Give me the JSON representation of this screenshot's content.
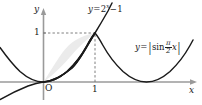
{
  "figure": {
    "background_color": "#ffffff",
    "axis_color": "#9a9a9a",
    "curve_color": "#1a1a1a",
    "shade_color": "#ebebeb",
    "shade_border_color": "#1a1a1a",
    "dotted_color": "#6f6f6f"
  },
  "axes": {
    "x_axis_label": "x",
    "y_axis_label": "y",
    "origin_label": "O",
    "x_ticks": [
      {
        "value": "1",
        "label": "1"
      }
    ],
    "y_ticks": [
      {
        "value": "1",
        "label": "1"
      }
    ],
    "x_range": [
      -1.05,
      3.3
    ],
    "y_range": [
      -0.62,
      1.55
    ]
  },
  "curves": [
    {
      "id": "exponential",
      "label_parts": {
        "lhs": "y",
        "equals": "=",
        "base": "2",
        "exponent": "x",
        "minus": "−",
        "constant": "1"
      },
      "label_plain": "y = 2^x − 1",
      "expression": "2^x - 1"
    },
    {
      "id": "abs-sine",
      "label_parts": {
        "lhs": "y",
        "equals": "=",
        "open_bar": "|",
        "fn": "sin",
        "num": "π",
        "den": "2",
        "var": "x",
        "close_bar": "|"
      },
      "label_plain": "y = |sin (π/2) x|",
      "expression": "abs(sin(pi/2 * x))"
    }
  ],
  "shaded_region": {
    "description": "Region between y = |sin((pi/2)x)| and y = 2^x - 1 from x = 0 to x = 1",
    "from_x": "0",
    "to_x": "1"
  },
  "guides": [
    {
      "id": "horizontal-guide",
      "from": "(0,1)",
      "to": "(1,1)",
      "style": "dashed"
    },
    {
      "id": "vertical-guide",
      "from": "(1,0)",
      "to": "(1,1)",
      "style": "dashed"
    }
  ]
}
